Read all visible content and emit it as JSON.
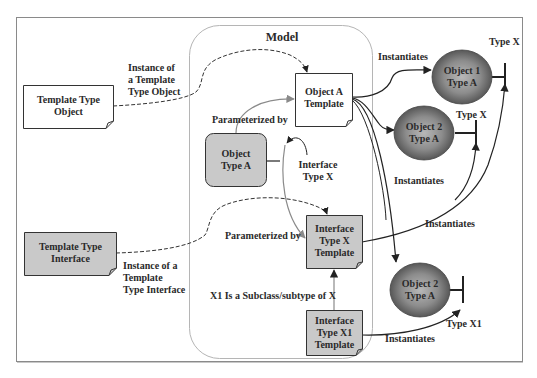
{
  "diagram": {
    "title": "Model",
    "colors": {
      "frame": "#8a8a8a",
      "model_border": "#b5b5b5",
      "gray_fill": "#c9c9c9",
      "white_fill": "#ffffff",
      "sphere_light": "#a9a9a9",
      "sphere_dark": "#4a4a4a",
      "solid_arrow": "#222222",
      "gray_arrow": "#8a8a8a"
    },
    "nodes": {
      "template_type_object": "Template Type\nObject",
      "template_type_interface": "Template Type\nInterface",
      "object_a_template": "Object A\nTemplate",
      "object_type_a": "Object\nType A",
      "interface_type_x_template": "Interface\nType X\nTemplate",
      "interface_type_x1_template": "Interface\nType X1\nTemplate",
      "object1_type_a": "Object 1\nType A",
      "object2_type_a_upper": "Object 2\nType A",
      "object2_type_a_lower": "Object 2\nType A"
    },
    "labels": {
      "instance_of_template_type_object": "Instance of\na Template\nType Object",
      "instance_of_template_type_interface": "Instance of a\nTemplate\nType Interface",
      "parameterized_by_top": "Parameterized by",
      "parameterized_by_bottom": "Parameterized by",
      "interface_type_x": "Interface\nType X",
      "x1_subclass": "X1 Is a Subclass/subtype of X",
      "instantiates_top": "Instantiates",
      "instantiates_middle": "Instantiates",
      "instantiates_right": "Instantiates",
      "instantiates_bottom": "Instantiates",
      "type_x_1": "Type X",
      "type_x_2": "Type X",
      "type_x1": "Type X1"
    }
  }
}
